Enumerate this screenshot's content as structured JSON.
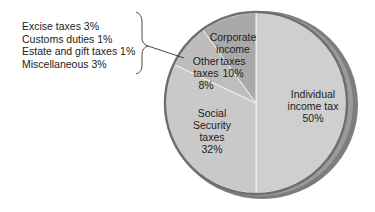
{
  "chart_data": {
    "type": "pie",
    "title": "",
    "categories": [
      "Individual income tax",
      "Social Security taxes",
      "Other taxes",
      "Corporate income taxes"
    ],
    "values": [
      50,
      32,
      8,
      10
    ],
    "unit": "%",
    "slices": [
      {
        "name": "Individual income tax",
        "value": 50,
        "label_lines": [
          "Individual",
          "income tax",
          "50%"
        ],
        "color": "#cfcfcf"
      },
      {
        "name": "Social Security taxes",
        "value": 32,
        "label_lines": [
          "Social",
          "Security",
          "taxes",
          "32%"
        ],
        "color": "#c9c9c9"
      },
      {
        "name": "Other taxes",
        "value": 8,
        "label_lines": [
          "Other",
          "taxes",
          "8%"
        ],
        "color": "#bdbdbd"
      },
      {
        "name": "Corporate income taxes",
        "value": 10,
        "label_lines": [
          "Corporate",
          "income",
          "taxes",
          "10%"
        ],
        "color": "#a9a9a9"
      }
    ],
    "other_breakdown": [
      {
        "name": "Excise taxes",
        "value": 3,
        "label": "Excise taxes 3%"
      },
      {
        "name": "Customs duties",
        "value": 1,
        "label": "Customs duties 1%"
      },
      {
        "name": "Estate and gift taxes",
        "value": 1,
        "label": "Estate and gift taxes 1%"
      },
      {
        "name": "Miscellaneous",
        "value": 3,
        "label": "Miscellaneous 3%"
      }
    ],
    "legend_position": "left (callout bracket to Other taxes)"
  }
}
